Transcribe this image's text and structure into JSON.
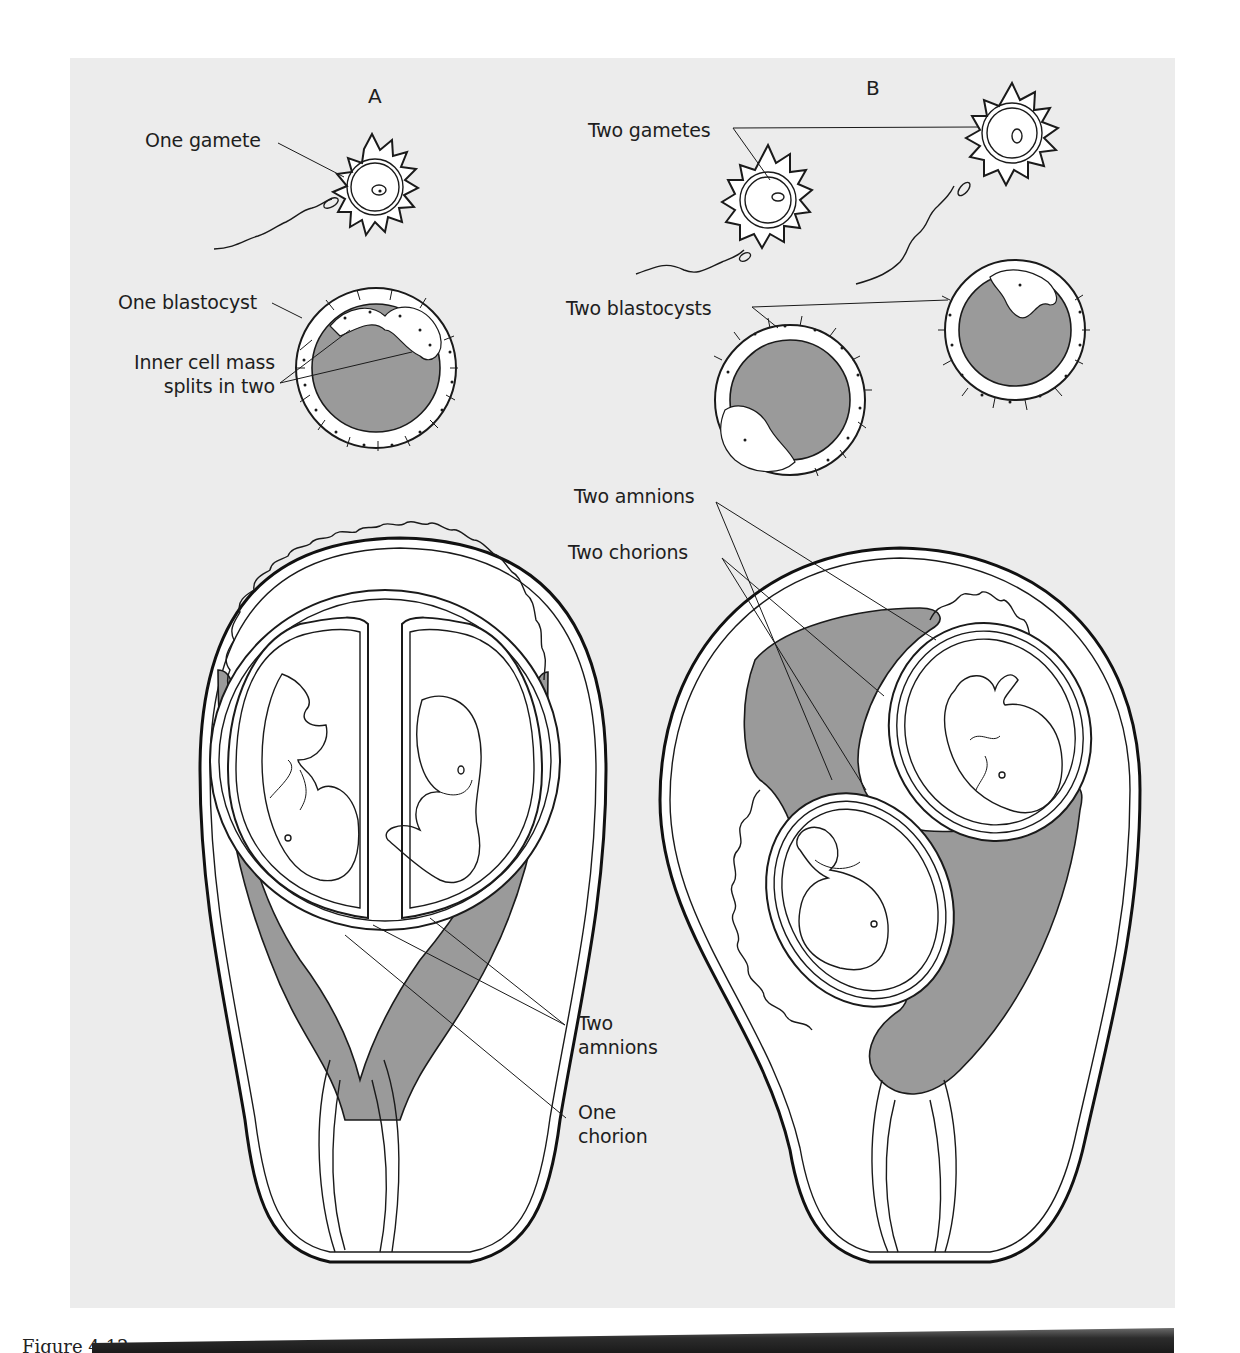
{
  "figure": {
    "caption": "Figure 4-12",
    "panels": [
      {
        "id": "A",
        "header": "A",
        "labels": {
          "gamete": "One gamete",
          "blastocyst": "One blastocyst",
          "inner_cell_mass_line1": "Inner cell mass",
          "inner_cell_mass_line2": "splits in two",
          "amnions_line1": "Two",
          "amnions_line2": "amnions",
          "chorion_line1": "One",
          "chorion_line2": "chorion"
        }
      },
      {
        "id": "B",
        "header": "B",
        "labels": {
          "gametes": "Two gametes",
          "blastocysts": "Two blastocysts",
          "amnions": "Two amnions",
          "chorions": "Two chorions"
        }
      }
    ],
    "colors": {
      "background_panel": "#ececec",
      "tissue_white": "#ffffff",
      "fluid_gray": "#9a9a9a",
      "outline": "#1a1a1a"
    }
  }
}
